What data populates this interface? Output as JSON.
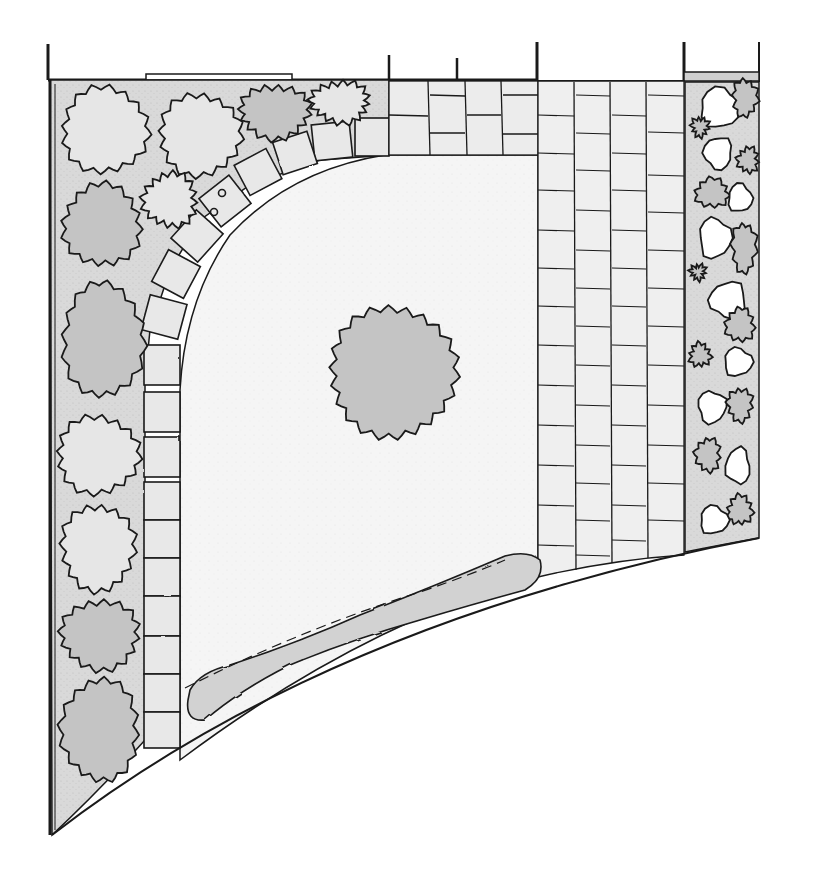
{
  "diagram": {
    "type": "garden-plan",
    "view": "top-down sketch",
    "colors": {
      "paper": "#ffffff",
      "ink": "#1a1a1a",
      "bed_fill": "#d6d6d6",
      "shrub_fill": "#c4c4c4",
      "shrub_light": "#e6e6e6",
      "lawn_fill": "#f3f3f3",
      "paving_fill": "#eeeeee"
    },
    "regions": [
      {
        "id": "left-border-bed",
        "label": "left planting border"
      },
      {
        "id": "curved-path",
        "label": "curved stepping-stone path"
      },
      {
        "id": "lawn",
        "label": "lawn"
      },
      {
        "id": "feature-tree",
        "label": "central specimen tree"
      },
      {
        "id": "paved-terrace",
        "label": "paved terrace"
      },
      {
        "id": "right-border-bed",
        "label": "right planting border"
      },
      {
        "id": "front-hedge",
        "label": "low hedge along curved edge"
      }
    ]
  }
}
